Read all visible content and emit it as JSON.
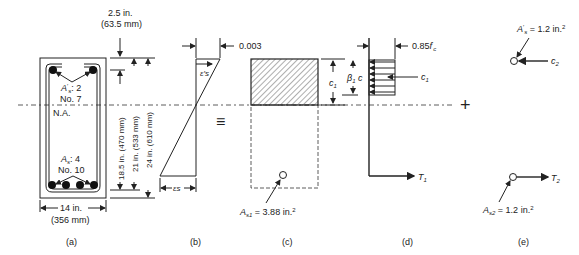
{
  "section_a": {
    "cover": "2.5 in.",
    "cover_mm": "(63.5 mm)",
    "top_steel": "A's: 2",
    "top_steel_sym": "A",
    "top_steel_val": ": 2",
    "top_bar": "No. 7",
    "na_label": "N.A.",
    "bot_steel_sym": "A",
    "bot_steel_val": ": 4",
    "bot_bar": "No. 10",
    "width": "14 in.",
    "width_mm": "(356 mm)",
    "d1": "18.5 in. (470 mm)",
    "d2": "21 in. (533 mm)",
    "d3": "24 in. (610 mm)",
    "caption": "(a)"
  },
  "section_b": {
    "strain_top": "0.003",
    "eps_prime": "ε's",
    "eps": "εs",
    "caption": "(b)"
  },
  "equiv_symbol": "≡",
  "section_c": {
    "as1_label": "As1 = 3.88 in.²",
    "caption": "(c)"
  },
  "section_d": {
    "stress": "0.85f'c",
    "c1_depth": "c1",
    "beta_c": "β1c",
    "force_c1": "c1",
    "force_t1": "T1",
    "caption": "(d)"
  },
  "plus_symbol": "+",
  "section_e": {
    "asp_label": "A's = 1.2 in.²",
    "force_c2": "c2",
    "as2_label": "As2 = 1.2 in.²",
    "force_t2": "T2",
    "caption": "(e)"
  }
}
